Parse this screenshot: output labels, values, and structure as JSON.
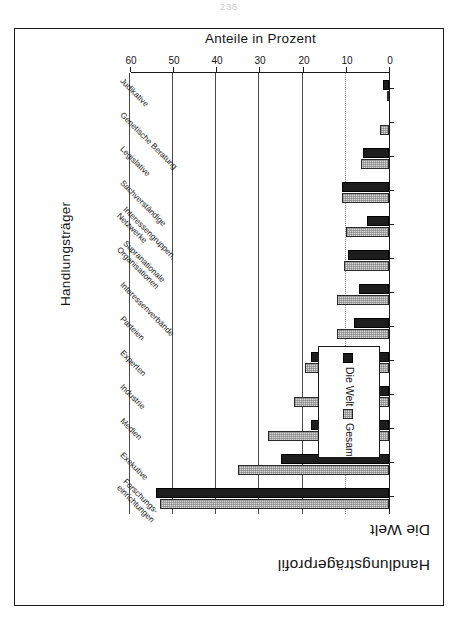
{
  "page": {
    "number": "236"
  },
  "figure": {
    "title_line1": "Handlungsträgerprofil",
    "title_line2": "Die Welt",
    "rotation_degrees": 180
  },
  "legend": {
    "position": "upper-left",
    "entries": [
      {
        "label": "Gesamt",
        "color": "#d8d8d8",
        "pattern": "dotted-fill"
      },
      {
        "label": "Die Welt",
        "color": "#1d1d1d",
        "pattern": "solid-fill"
      }
    ]
  },
  "chart_data": {
    "type": "bar",
    "orientation": "vertical-printed-rotated",
    "title": "Handlungsträgerprofil Die Welt",
    "xlabel": "Handlungsträger",
    "ylabel": "Anteile in Prozent",
    "ylim": [
      0,
      60
    ],
    "yticks": [
      0,
      10,
      20,
      30,
      40,
      50,
      60
    ],
    "ytick_labels": [
      "0",
      "10",
      "20",
      "30",
      "40",
      "50",
      "60"
    ],
    "grid": true,
    "legend_position": "upper left",
    "categories": [
      "Forschungs-\neinrichtungen",
      "Exekutive",
      "Medien",
      "Industrie",
      "Experten",
      "Parteien",
      "Interessenverbände",
      "Supranationale\nOrganisationen",
      "Interessengruppen,\nNetzwerke",
      "Sachverständige",
      "Legislative",
      "Genetische Beratung",
      "Judikative"
    ],
    "series": [
      {
        "name": "Gesamt",
        "color": "#d8d8d8",
        "values": [
          53.0,
          35.0,
          28.0,
          22.0,
          19.5,
          12.0,
          12.0,
          10.5,
          10.0,
          11.0,
          6.5,
          2.0,
          0.5
        ]
      },
      {
        "name": "Die Welt",
        "color": "#1d1d1d",
        "values": [
          54.0,
          25.0,
          18.0,
          16.0,
          18.0,
          8.0,
          7.0,
          9.5,
          5.0,
          11.0,
          6.0,
          0.0,
          1.5
        ]
      }
    ]
  }
}
